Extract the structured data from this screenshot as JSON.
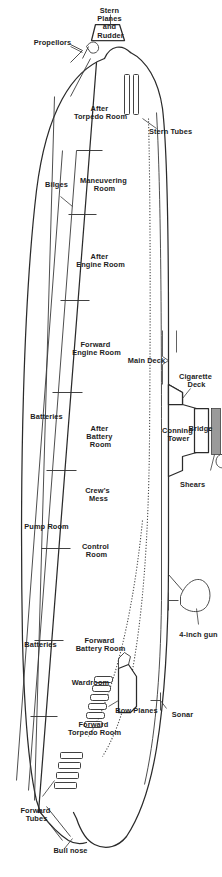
{
  "diagram": {
    "orientation_note": "rotated-90-degrees",
    "colors": {
      "ink": "#2b2b2b",
      "paper": "#ffffff",
      "hatch": "#9a9a9a",
      "light_hatch": "#d8d8d8"
    },
    "labels": {
      "stern_tubes": "Stern Tubes",
      "stern_planes_and_rudder": "Stern Planes and Rudder",
      "stern_planes_l1": "Stern",
      "stern_planes_l2": "Planes",
      "stern_planes_l3": "and",
      "stern_planes_l4": "Rudder",
      "propellors": "Propellors",
      "after_torpedo_room_l1": "After",
      "after_torpedo_room_l2": "Torpedo Room",
      "maneuvering_room_l1": "Maneuvering",
      "maneuvering_room_l2": "Room",
      "after_engine_room_l1": "After",
      "after_engine_room_l2": "Engine Room",
      "forward_engine_room_l1": "Forward",
      "forward_engine_room_l2": "Engine Room",
      "after_battery_room_l1": "After",
      "after_battery_room_l2": "Battery",
      "after_battery_room_l3": "Room",
      "crews_mess_l1": "Crew's",
      "crews_mess_l2": "Mess",
      "control_room_l1": "Control",
      "control_room_l2": "Room",
      "forward_battery_room_l1": "Forward",
      "forward_battery_room_l2": "Battery Room",
      "wardroom": "Wardroom",
      "forward_torpedo_room_l1": "Forward",
      "forward_torpedo_room_l2": "Torpedo Room",
      "bilges": "Bilges",
      "batteries_aft": "Batteries",
      "batteries_fwd": "Batteries",
      "pump_room": "Pump Room",
      "main_deck": "Main Deck",
      "cigarette_deck_l1": "Cigarette",
      "cigarette_deck_l2": "Deck",
      "conning_tower_l1": "Conning",
      "conning_tower_l2": "Tower",
      "bridge": "Bridge",
      "radar": "Radar",
      "shears": "Shears",
      "four_inch_gun": "4-inch gun",
      "sonar": "Sonar",
      "bow_planes": "Bow Planes",
      "bull_nose": "Bull nose",
      "forward_tubes_l1": "Forward",
      "forward_tubes_l2": "Tubes"
    }
  }
}
